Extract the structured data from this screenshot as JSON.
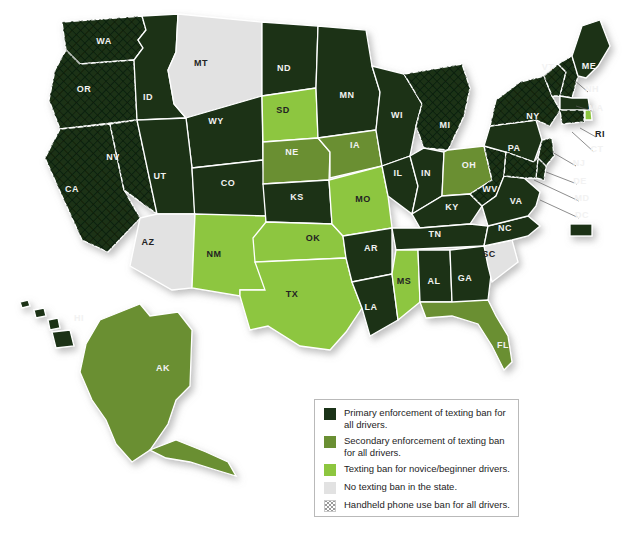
{
  "map": {
    "title": "US texting ban enforcement by state",
    "background": "#ffffff",
    "colors": {
      "primary": "#1b3318",
      "secondary": "#6a8f33",
      "novice": "#8dc63f",
      "none": "#e2e2e2",
      "border": "#ffffff",
      "hatch": "#0d1f0c"
    },
    "states": [
      {
        "code": "WA",
        "category": "primary",
        "handheld": true,
        "lx": 104,
        "ly": 44
      },
      {
        "code": "OR",
        "category": "primary",
        "handheld": true,
        "lx": 84,
        "ly": 92
      },
      {
        "code": "CA",
        "category": "primary",
        "handheld": true,
        "lx": 72,
        "ly": 192
      },
      {
        "code": "NV",
        "category": "primary",
        "handheld": true,
        "lx": 113,
        "ly": 160
      },
      {
        "code": "ID",
        "category": "primary",
        "handheld": false,
        "lx": 148,
        "ly": 100
      },
      {
        "code": "MT",
        "category": "none",
        "handheld": false,
        "lx": 201,
        "ly": 66
      },
      {
        "code": "WY",
        "category": "primary",
        "handheld": false,
        "lx": 216,
        "ly": 124
      },
      {
        "code": "UT",
        "category": "primary",
        "handheld": false,
        "lx": 160,
        "ly": 179
      },
      {
        "code": "CO",
        "category": "primary",
        "handheld": false,
        "lx": 228,
        "ly": 186
      },
      {
        "code": "AZ",
        "category": "none",
        "handheld": false,
        "lx": 148,
        "ly": 245
      },
      {
        "code": "NM",
        "category": "novice",
        "handheld": false,
        "lx": 214,
        "ly": 257
      },
      {
        "code": "ND",
        "category": "primary",
        "handheld": false,
        "lx": 284,
        "ly": 71
      },
      {
        "code": "SD",
        "category": "novice",
        "handheld": false,
        "lx": 283,
        "ly": 113
      },
      {
        "code": "NE",
        "category": "secondary",
        "handheld": false,
        "lx": 292,
        "ly": 155
      },
      {
        "code": "KS",
        "category": "primary",
        "handheld": false,
        "lx": 297,
        "ly": 200
      },
      {
        "code": "OK",
        "category": "novice",
        "handheld": false,
        "lx": 313,
        "ly": 241
      },
      {
        "code": "TX",
        "category": "novice",
        "handheld": false,
        "lx": 292,
        "ly": 297
      },
      {
        "code": "MN",
        "category": "primary",
        "handheld": false,
        "lx": 347,
        "ly": 98
      },
      {
        "code": "IA",
        "category": "secondary",
        "handheld": false,
        "lx": 355,
        "ly": 148
      },
      {
        "code": "MO",
        "category": "novice",
        "handheld": false,
        "lx": 363,
        "ly": 202
      },
      {
        "code": "AR",
        "category": "primary",
        "handheld": false,
        "lx": 371,
        "ly": 251
      },
      {
        "code": "LA",
        "category": "primary",
        "handheld": false,
        "lx": 371,
        "ly": 310
      },
      {
        "code": "WI",
        "category": "primary",
        "handheld": false,
        "lx": 397,
        "ly": 118
      },
      {
        "code": "IL",
        "category": "primary",
        "handheld": false,
        "lx": 398,
        "ly": 176
      },
      {
        "code": "MS",
        "category": "novice",
        "handheld": false,
        "lx": 404,
        "ly": 284
      },
      {
        "code": "MI",
        "category": "primary",
        "handheld": true,
        "lx": 445,
        "ly": 128
      },
      {
        "code": "IN",
        "category": "primary",
        "handheld": false,
        "lx": 426,
        "ly": 176
      },
      {
        "code": "KY",
        "category": "primary",
        "handheld": false,
        "lx": 452,
        "ly": 210
      },
      {
        "code": "TN",
        "category": "primary",
        "handheld": false,
        "lx": 435,
        "ly": 237
      },
      {
        "code": "AL",
        "category": "primary",
        "handheld": false,
        "lx": 434,
        "ly": 284
      },
      {
        "code": "GA",
        "category": "primary",
        "handheld": false,
        "lx": 465,
        "ly": 281
      },
      {
        "code": "FL",
        "category": "secondary",
        "handheld": false,
        "lx": 503,
        "ly": 348
      },
      {
        "code": "OH",
        "category": "secondary",
        "handheld": false,
        "lx": 469,
        "ly": 168
      },
      {
        "code": "WV",
        "category": "primary",
        "handheld": true,
        "lx": 490,
        "ly": 192
      },
      {
        "code": "VA",
        "category": "primary",
        "handheld": false,
        "lx": 516,
        "ly": 204
      },
      {
        "code": "NC",
        "category": "primary",
        "handheld": false,
        "lx": 505,
        "ly": 231
      },
      {
        "code": "SC",
        "category": "none",
        "handheld": false,
        "lx": 489,
        "ly": 257
      },
      {
        "code": "PA",
        "category": "primary",
        "handheld": false,
        "lx": 514,
        "ly": 151
      },
      {
        "code": "NY",
        "category": "primary",
        "handheld": true,
        "lx": 533,
        "ly": 119
      },
      {
        "code": "VT",
        "category": "primary",
        "handheld": true,
        "lx": 548,
        "ly": 70
      },
      {
        "code": "ME",
        "category": "primary",
        "handheld": false,
        "lx": 589,
        "ly": 69
      },
      {
        "code": "NH",
        "category": "primary",
        "handheld": true,
        "lx": 592,
        "ly": 92
      },
      {
        "code": "MA",
        "category": "primary",
        "handheld": false,
        "lx": 596,
        "ly": 111
      },
      {
        "code": "RI",
        "category": "novice",
        "handheld": false,
        "lx": 600,
        "ly": 137
      },
      {
        "code": "CT",
        "category": "primary",
        "handheld": true,
        "lx": 597,
        "ly": 152
      },
      {
        "code": "NJ",
        "category": "primary",
        "handheld": true,
        "lx": 579,
        "ly": 166
      },
      {
        "code": "DE",
        "category": "primary",
        "handheld": true,
        "lx": 580,
        "ly": 184
      },
      {
        "code": "MD",
        "category": "primary",
        "handheld": true,
        "lx": 582,
        "ly": 201
      },
      {
        "code": "DC",
        "category": "primary",
        "handheld": false,
        "lx": 582,
        "ly": 218
      },
      {
        "code": "HI",
        "category": "primary",
        "handheld": false,
        "lx": 79,
        "ly": 321
      },
      {
        "code": "AK",
        "category": "secondary",
        "handheld": false,
        "lx": 163,
        "ly": 371
      }
    ]
  },
  "legend": {
    "items": [
      {
        "swatch": "primary",
        "label": "Primary enforcement of texting ban for all drivers."
      },
      {
        "swatch": "secondary",
        "label": "Secondary enforcement of texting ban for all drivers."
      },
      {
        "swatch": "novice",
        "label": "Texting ban for novice/beginner drivers."
      },
      {
        "swatch": "none",
        "label": "No texting ban in the state."
      },
      {
        "swatch": "hatch",
        "label": "Handheld phone use ban for all drivers."
      }
    ]
  }
}
